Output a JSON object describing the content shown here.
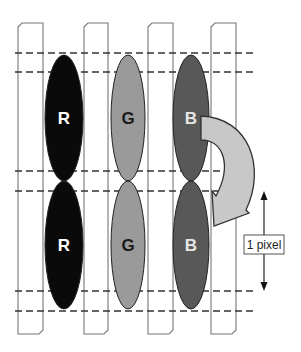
{
  "diagram": {
    "colors": {
      "background": "#ffffff",
      "strip_stroke": "#777777",
      "dash_stroke": "#333333",
      "red_subpixel": "#0a0a0a",
      "green_subpixel": "#9a9a9a",
      "blue_subpixel": "#585858",
      "arrow_fill": "#c8c8c8",
      "arrow_stroke": "#333333"
    },
    "strips": [
      {
        "x": 18,
        "width": 25
      },
      {
        "x": 84,
        "width": 24
      },
      {
        "x": 148,
        "width": 25
      },
      {
        "x": 211,
        "width": 25
      }
    ],
    "strip_top": 23,
    "strip_bottom": 334,
    "dashed_lines_y": [
      53,
      72,
      171,
      191,
      291,
      311
    ],
    "dash_x_start": 15,
    "dash_x_end": 255,
    "subpixels": [
      {
        "letter": "R",
        "row": 1,
        "cx": 64,
        "cy": 118,
        "rx": 19,
        "ry": 63,
        "fill_key": "red_subpixel",
        "text_color": "#ffffff"
      },
      {
        "letter": "G",
        "row": 1,
        "cx": 128,
        "cy": 118,
        "rx": 17,
        "ry": 63,
        "fill_key": "green_subpixel",
        "text_color": "#1a1a1a"
      },
      {
        "letter": "B",
        "row": 1,
        "cx": 191,
        "cy": 118,
        "rx": 18,
        "ry": 63,
        "fill_key": "blue_subpixel",
        "text_color": "#e6e6e6"
      },
      {
        "letter": "R",
        "row": 2,
        "cx": 64,
        "cy": 245,
        "rx": 19,
        "ry": 64,
        "fill_key": "red_subpixel",
        "text_color": "#ffffff"
      },
      {
        "letter": "G",
        "row": 2,
        "cx": 128,
        "cy": 245,
        "rx": 17,
        "ry": 64,
        "fill_key": "green_subpixel",
        "text_color": "#1a1a1a"
      },
      {
        "letter": "B",
        "row": 2,
        "cx": 191,
        "cy": 245,
        "rx": 18,
        "ry": 64,
        "fill_key": "blue_subpixel",
        "text_color": "#e6e6e6"
      }
    ],
    "curved_arrow": {
      "from": "B (row 1)",
      "to": "B (row 2)"
    },
    "measure": {
      "label": "1 pixel",
      "x": 264,
      "y_top": 192,
      "y_bottom": 290
    }
  }
}
